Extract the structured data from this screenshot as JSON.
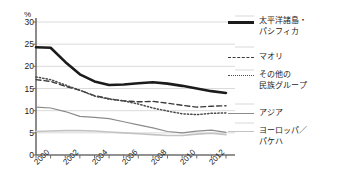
{
  "axis": {
    "y_unit": "%",
    "y_ticks": [
      "0",
      "5",
      "10",
      "15",
      "20",
      "25",
      "30"
    ],
    "x_ticks": [
      "2000",
      "2002",
      "2004",
      "2006",
      "2008",
      "2010",
      "2012"
    ]
  },
  "legend": {
    "items": [
      {
        "label": "太平洋諸島・\nパシフィカ",
        "style": "solid-thick",
        "color": "#1b1b1b"
      },
      {
        "label": "マオリ",
        "style": "dashed",
        "color": "#3a3a3a"
      },
      {
        "label": "その他の\n民族グループ",
        "style": "dotted",
        "color": "#4a4a4a"
      },
      {
        "label": "アジア",
        "style": "solid",
        "color": "#8b8b8b"
      },
      {
        "label": "ヨーロッパ／\nパケハ",
        "style": "solid-light",
        "color": "#c3c3c3"
      }
    ]
  },
  "chart_data": {
    "type": "line",
    "title": "",
    "xlabel": "",
    "ylabel": "%",
    "ylim": [
      0,
      30
    ],
    "xlim": [
      2000,
      2013
    ],
    "grid": "horizontal",
    "legend_position": "right",
    "x": [
      2000,
      2001,
      2002,
      2003,
      2004,
      2005,
      2006,
      2007,
      2008,
      2009,
      2010,
      2011,
      2012,
      2013
    ],
    "series": [
      {
        "name": "太平洋諸島・パシフィカ",
        "color": "#1b1b1b",
        "style": "solid-thick",
        "values": [
          24.3,
          24.2,
          21.0,
          18.2,
          16.6,
          15.8,
          15.9,
          16.2,
          16.4,
          16.1,
          15.6,
          15.0,
          14.4,
          14.0
        ]
      },
      {
        "name": "マオリ",
        "color": "#3a3a3a",
        "style": "dashed",
        "values": [
          17.0,
          16.6,
          15.5,
          14.6,
          13.4,
          12.7,
          12.2,
          12.0,
          12.1,
          11.7,
          11.2,
          10.8,
          11.0,
          11.1
        ]
      },
      {
        "name": "その他の民族グループ",
        "color": "#4a4a4a",
        "style": "dotted",
        "values": [
          17.6,
          17.0,
          15.8,
          14.6,
          13.3,
          12.6,
          12.2,
          11.5,
          10.6,
          9.9,
          9.3,
          9.1,
          9.4,
          9.5
        ]
      },
      {
        "name": "アジア",
        "color": "#8b8b8b",
        "style": "solid",
        "values": [
          10.8,
          10.6,
          9.8,
          8.7,
          8.5,
          8.2,
          7.5,
          6.8,
          6.1,
          5.3,
          5.0,
          5.4,
          5.6,
          5.1
        ]
      },
      {
        "name": "ヨーロッパ／パケハ",
        "color": "#c3c3c3",
        "style": "solid-light",
        "values": [
          5.3,
          5.4,
          5.5,
          5.5,
          5.4,
          5.2,
          5.0,
          4.8,
          4.6,
          4.4,
          4.4,
          4.7,
          4.9,
          4.6
        ]
      }
    ]
  }
}
